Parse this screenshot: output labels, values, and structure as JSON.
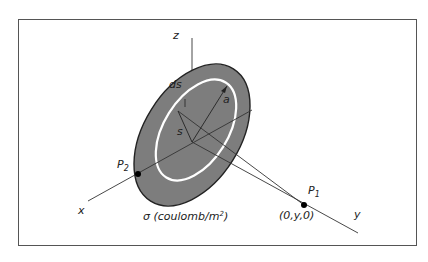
{
  "diagram": {
    "axes": {
      "z": "z",
      "x": "x",
      "y": "y"
    },
    "labels": {
      "ds": "ds",
      "a": "a",
      "s": "s",
      "p2": "P",
      "p2_sub": "2",
      "p1": "P",
      "p1_sub": "1",
      "p1_coord": "(0,y,0)",
      "sigma": "σ (coulomb/m",
      "sigma_sup": "2",
      "sigma_close": ")"
    },
    "colors": {
      "disk": "#7a7a7a",
      "ring": "#ffffff",
      "frame": "#555555"
    }
  }
}
